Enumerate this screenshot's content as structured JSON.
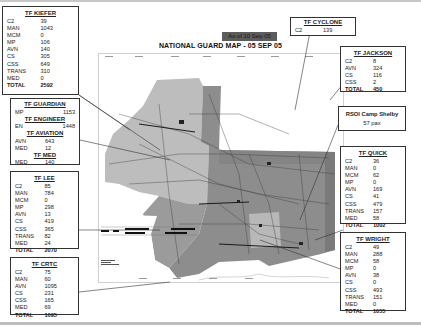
{
  "header": {
    "as_of": "As of 10 Sep 05",
    "title": "NATIONAL GUARD MAP - 05 SEP 05"
  },
  "task_forces": {
    "kiefer": {
      "name": "TF KIEFER",
      "rows": [
        {
          "k": "C2",
          "v": "39"
        },
        {
          "k": "MAN",
          "v": "1043"
        },
        {
          "k": "MCM",
          "v": "0"
        },
        {
          "k": "MP",
          "v": "106"
        },
        {
          "k": "AVN",
          "v": "140"
        },
        {
          "k": "CS",
          "v": "305"
        },
        {
          "k": "CSS",
          "v": "649"
        },
        {
          "k": "TRANS",
          "v": "310"
        },
        {
          "k": "MED",
          "v": "0"
        }
      ],
      "total_label": "TOTAL",
      "total": "2592"
    },
    "guardian_group": {
      "guardian": {
        "name": "TF GUARDIAN",
        "rows": [
          {
            "k": "MP",
            "v": "1153"
          }
        ]
      },
      "engineer": {
        "name": "TF ENGINEER",
        "rows": [
          {
            "k": "EN",
            "v": "1448"
          }
        ]
      },
      "aviation": {
        "name": "TF AVIATION",
        "rows": [
          {
            "k": "AVN",
            "v": "643"
          },
          {
            "k": "MED",
            "v": "12"
          }
        ]
      },
      "med": {
        "name": "TF MED",
        "rows": [
          {
            "k": "MED",
            "v": "140"
          }
        ]
      }
    },
    "lee": {
      "name": "TF LEE",
      "rows": [
        {
          "k": "C2",
          "v": "85"
        },
        {
          "k": "MAN",
          "v": "784"
        },
        {
          "k": "MCM",
          "v": "0"
        },
        {
          "k": "MP",
          "v": "298"
        },
        {
          "k": "AVN",
          "v": "13"
        },
        {
          "k": "CS",
          "v": "419"
        },
        {
          "k": "CSS",
          "v": "365"
        },
        {
          "k": "TRANS",
          "v": "82"
        },
        {
          "k": "MED",
          "v": "24"
        }
      ],
      "total_label": "TOTAL",
      "total": "2070"
    },
    "crtc": {
      "name": "TF CRTC",
      "rows": [
        {
          "k": "C2",
          "v": "75"
        },
        {
          "k": "MAN",
          "v": "60"
        },
        {
          "k": "AVN",
          "v": "1095"
        },
        {
          "k": "CS",
          "v": "231"
        },
        {
          "k": "CSS",
          "v": "165"
        },
        {
          "k": "MED",
          "v": "69"
        }
      ],
      "total_label": "TOTAL",
      "total": "1695"
    },
    "cyclone": {
      "name": "TF CYCLONE",
      "rows": [
        {
          "k": "C2",
          "v": "139"
        }
      ]
    },
    "jackson": {
      "name": "TF JACKSON",
      "rows": [
        {
          "k": "C2",
          "v": "8"
        },
        {
          "k": "AVN",
          "v": "324"
        },
        {
          "k": "CS",
          "v": "116"
        },
        {
          "k": "CSS",
          "v": "2"
        }
      ],
      "total_label": "TOTAL",
      "total": "450"
    },
    "quick": {
      "name": "TF QUICK",
      "rows": [
        {
          "k": "C2",
          "v": "36"
        },
        {
          "k": "MAN",
          "v": "0"
        },
        {
          "k": "MCM",
          "v": "62"
        },
        {
          "k": "MP",
          "v": "0"
        },
        {
          "k": "AVN",
          "v": "169"
        },
        {
          "k": "CS",
          "v": "41"
        },
        {
          "k": "CSS",
          "v": "479"
        },
        {
          "k": "TRANS",
          "v": "157"
        },
        {
          "k": "MED",
          "v": "58"
        }
      ],
      "total_label": "TOTAL",
      "total": "1002"
    },
    "wright": {
      "name": "TF WRIGHT",
      "rows": [
        {
          "k": "C2",
          "v": "49"
        },
        {
          "k": "MAN",
          "v": "288"
        },
        {
          "k": "MCM",
          "v": "58"
        },
        {
          "k": "MP",
          "v": "0"
        },
        {
          "k": "AVN",
          "v": "38"
        },
        {
          "k": "CS",
          "v": "0"
        },
        {
          "k": "CSS",
          "v": "493"
        },
        {
          "k": "TRANS",
          "v": "151"
        },
        {
          "k": "MED",
          "v": "0"
        }
      ],
      "total_label": "TOTAL",
      "total": "1055"
    }
  },
  "rsoi": {
    "title": "RSOI Camp Shelby",
    "pax": "57 pax"
  },
  "colors": {
    "as_of_bg": "#5c5c5c",
    "map_light": "#bcbcbc",
    "map_dark": "#8a8a8a",
    "border": "#333333"
  }
}
